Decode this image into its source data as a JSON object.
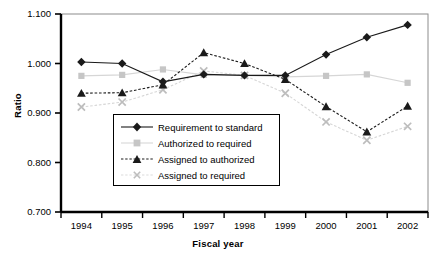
{
  "chart_data": {
    "type": "line",
    "title": "",
    "xlabel": "Fiscal year",
    "ylabel": "Ratio",
    "categories": [
      "1994",
      "1995",
      "1996",
      "1997",
      "1998",
      "1999",
      "2000",
      "2001",
      "2002"
    ],
    "ylim": [
      0.7,
      1.1
    ],
    "yticks": [
      "0.700",
      "0.800",
      "0.900",
      "1.000",
      "1.100"
    ],
    "ytick_values": [
      0.7,
      0.8,
      0.9,
      1.0,
      1.1
    ],
    "grid": false,
    "legend_position": "inside-lower-left",
    "series": [
      {
        "name": "Requirement to standard",
        "color": "#1a1a1a",
        "marker": "diamond",
        "line": "solid",
        "values": [
          1.003,
          1.0,
          0.963,
          0.978,
          0.976,
          0.976,
          1.018,
          1.053,
          1.078
        ]
      },
      {
        "name": "Authorized to required",
        "color": "#c6c6c6",
        "marker": "square",
        "line": "solid",
        "values": [
          0.975,
          0.977,
          0.988,
          0.977,
          0.976,
          0.973,
          0.975,
          0.978,
          0.961
        ]
      },
      {
        "name": "Assigned to authorized",
        "color": "#1a1a1a",
        "marker": "triangle",
        "line": "dashed",
        "values": [
          0.94,
          0.941,
          0.957,
          1.022,
          1.0,
          0.968,
          0.913,
          0.862,
          0.914
        ]
      },
      {
        "name": "Assigned to required",
        "color": "#c6c6c6",
        "marker": "cross",
        "line": "dashed",
        "values": [
          0.912,
          0.922,
          0.947,
          0.985,
          0.976,
          0.94,
          0.882,
          0.845,
          0.873
        ]
      }
    ]
  },
  "legend": {
    "entries": [
      "Requirement to standard",
      "Authorized to required",
      "Assigned to authorized",
      "Assigned to required"
    ]
  },
  "colors": {
    "dark_series": "#1a1a1a",
    "light_series": "#c6c6c6",
    "axis": "#000000",
    "frame": "#8c8c8c",
    "background": "#ffffff"
  }
}
